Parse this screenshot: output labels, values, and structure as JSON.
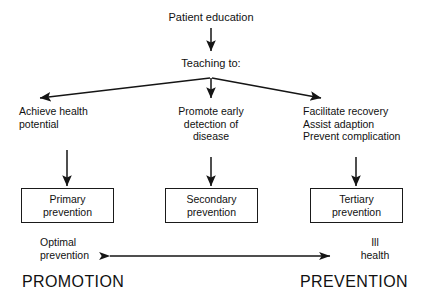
{
  "diagram": {
    "title_node": "Patient education",
    "second_node": "Teaching to:",
    "branches": [
      {
        "id": "left",
        "text": "Achieve health\npotential"
      },
      {
        "id": "middle",
        "text": "Promote early\ndetection of\ndisease"
      },
      {
        "id": "right",
        "text": "Facilitate recovery\nAssist adaption\nPrevent complication"
      }
    ],
    "boxes": [
      {
        "id": "primary",
        "label": "Primary\nprevention"
      },
      {
        "id": "secondary",
        "label": "Secondary\nprevention"
      },
      {
        "id": "tertiary",
        "label": "Tertiary\nprevention"
      }
    ],
    "continuum": {
      "left_label": "Optimal\nprevention",
      "right_label": "Ill\nhealth",
      "left_heading": "PROMOTION",
      "right_heading": "PREVENTION"
    },
    "colors": {
      "ink": "#111111",
      "background": "#ffffff"
    }
  }
}
